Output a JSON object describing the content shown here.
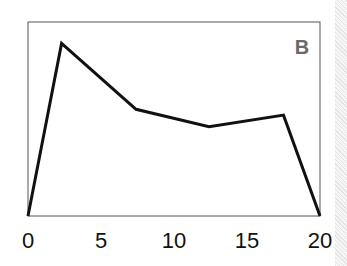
{
  "chart_data": {
    "type": "line",
    "title": "",
    "panel_label": "B",
    "xlabel": "",
    "ylabel": "",
    "xlim": [
      0,
      20
    ],
    "ylim": [
      0,
      1
    ],
    "xticks": [
      0,
      5,
      10,
      15,
      20
    ],
    "grid": false,
    "series": [
      {
        "name": "",
        "x": [
          0,
          2.3,
          7.4,
          12.4,
          17.5,
          20
        ],
        "y": [
          0,
          0.89,
          0.55,
          0.46,
          0.52,
          0
        ]
      }
    ]
  },
  "colors": {
    "line": "#111111",
    "frame": "#555555",
    "label": "#6a6a6a"
  }
}
